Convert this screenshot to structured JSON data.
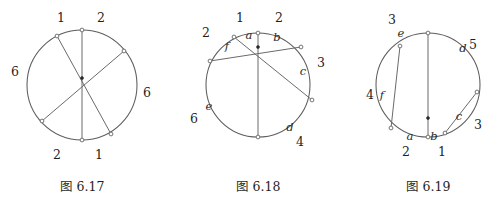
{
  "page": {
    "background_color": "#ffffff",
    "stroke_color": "#5d5d5d",
    "text_color": "#1f1f1f"
  },
  "figures": [
    {
      "id": "fig-6-17",
      "caption": "图 6.17",
      "circle": {
        "cx": 82,
        "cy": 85,
        "r": 55
      },
      "interior_point": {
        "x": 82,
        "y": 78
      },
      "chords": [
        {
          "name": "chord-vertical",
          "x1": 82,
          "y1": 30,
          "x2": 82,
          "y2": 140
        },
        {
          "name": "chord-upper-left-to-lower-right",
          "x1": 57,
          "y1": 36,
          "x2": 111,
          "y2": 134
        },
        {
          "name": "chord-upper-right-to-lower-left",
          "x1": 124,
          "y1": 51,
          "x2": 42,
          "y2": 121
        }
      ],
      "endpoints": [
        {
          "x": 82,
          "y": 30
        },
        {
          "x": 82,
          "y": 140
        },
        {
          "x": 57,
          "y": 36
        },
        {
          "x": 111,
          "y": 134
        },
        {
          "x": 124,
          "y": 51
        },
        {
          "x": 42,
          "y": 121
        }
      ],
      "number_labels": [
        {
          "text": "1",
          "x": 61,
          "y": 18
        },
        {
          "text": "2",
          "x": 101,
          "y": 18
        },
        {
          "text": "6",
          "x": 15,
          "y": 72
        },
        {
          "text": "6",
          "x": 147,
          "y": 93
        },
        {
          "text": "2",
          "x": 57,
          "y": 155
        },
        {
          "text": "1",
          "x": 99,
          "y": 155
        }
      ],
      "letter_labels": []
    },
    {
      "id": "fig-6-18",
      "caption": "图 6.18",
      "circle": {
        "cx": 258,
        "cy": 85,
        "r": 52
      },
      "interior_point": {
        "x": 258,
        "y": 47
      },
      "chords": [
        {
          "name": "chord-vertical",
          "x1": 258,
          "y1": 33,
          "x2": 258,
          "y2": 137
        },
        {
          "name": "chord-through-f-to-c",
          "x1": 234,
          "y1": 37,
          "x2": 312,
          "y2": 100
        },
        {
          "name": "chord-through-b-to-e",
          "x1": 301,
          "y1": 47,
          "x2": 210,
          "y2": 61
        }
      ],
      "endpoints": [
        {
          "x": 258,
          "y": 33
        },
        {
          "x": 258,
          "y": 137
        },
        {
          "x": 234,
          "y": 37
        },
        {
          "x": 312,
          "y": 100
        },
        {
          "x": 301,
          "y": 47
        },
        {
          "x": 210,
          "y": 61
        }
      ],
      "number_labels": [
        {
          "text": "1",
          "x": 240,
          "y": 18
        },
        {
          "text": "2",
          "x": 279,
          "y": 18
        },
        {
          "text": "2",
          "x": 206,
          "y": 33
        },
        {
          "text": "3",
          "x": 321,
          "y": 63
        },
        {
          "text": "4",
          "x": 300,
          "y": 142
        },
        {
          "text": "6",
          "x": 194,
          "y": 119
        }
      ],
      "letter_labels": [
        {
          "text": "a",
          "x": 249,
          "y": 36
        },
        {
          "text": "b",
          "x": 277,
          "y": 38
        },
        {
          "text": "c",
          "x": 303,
          "y": 72
        },
        {
          "text": "d",
          "x": 290,
          "y": 128
        },
        {
          "text": "e",
          "x": 209,
          "y": 107
        },
        {
          "text": "f",
          "x": 227,
          "y": 47
        }
      ]
    },
    {
      "id": "fig-6-19",
      "caption": "图 6.19",
      "circle": {
        "cx": 428,
        "cy": 85,
        "r": 52
      },
      "interior_point": {
        "x": 428,
        "y": 118
      },
      "chords": [
        {
          "name": "chord-vertical",
          "x1": 428,
          "y1": 33,
          "x2": 428,
          "y2": 137
        },
        {
          "name": "chord-through-e-to-a",
          "x1": 400,
          "y1": 46,
          "x2": 391,
          "y2": 128
        },
        {
          "name": "chord-through-d-to-c",
          "x1": 477,
          "y1": 92,
          "x2": 445,
          "y2": 133
        }
      ],
      "endpoints": [
        {
          "x": 428,
          "y": 33
        },
        {
          "x": 428,
          "y": 137
        },
        {
          "x": 400,
          "y": 46
        },
        {
          "x": 391,
          "y": 128
        },
        {
          "x": 477,
          "y": 92
        },
        {
          "x": 445,
          "y": 133
        }
      ],
      "number_labels": [
        {
          "text": "3",
          "x": 392,
          "y": 20
        },
        {
          "text": "5",
          "x": 473,
          "y": 45
        },
        {
          "text": "3",
          "x": 478,
          "y": 125
        },
        {
          "text": "2",
          "x": 406,
          "y": 152
        },
        {
          "text": "1",
          "x": 442,
          "y": 152
        },
        {
          "text": "4",
          "x": 370,
          "y": 95
        }
      ],
      "letter_labels": [
        {
          "text": "e",
          "x": 401,
          "y": 34
        },
        {
          "text": "d",
          "x": 463,
          "y": 49
        },
        {
          "text": "c",
          "x": 459,
          "y": 117
        },
        {
          "text": "b",
          "x": 434,
          "y": 137
        },
        {
          "text": "a",
          "x": 410,
          "y": 137
        },
        {
          "text": "f",
          "x": 382,
          "y": 96
        }
      ]
    }
  ]
}
